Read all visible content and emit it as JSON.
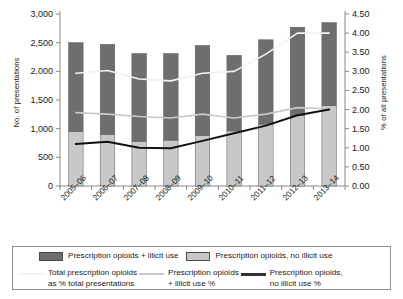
{
  "chart_data": {
    "type": "bar",
    "title": "",
    "subtitle": "",
    "xlabel": "",
    "ylabel": "No. of presentations",
    "y2label": "% of all presentations",
    "categories": [
      "2005–06",
      "2006–07",
      "2007–08",
      "2008–09",
      "2009–10",
      "2010–11",
      "2011–12",
      "2012–13",
      "2013–14"
    ],
    "ylim": [
      0,
      3000
    ],
    "yticks": [
      0,
      500,
      1000,
      1500,
      2000,
      2500,
      3000
    ],
    "ytick_labels": [
      "0",
      "500",
      "1,000",
      "1,500",
      "2,000",
      "2,500",
      "3,000"
    ],
    "y2lim": [
      0,
      4.5
    ],
    "y2ticks": [
      0,
      0.5,
      1,
      1.5,
      2,
      2.5,
      3,
      3.5,
      4,
      4.5
    ],
    "y2tick_labels": [
      "0.00",
      "0.50",
      "1.00",
      "1.50",
      "2.00",
      "2.50",
      "3.00",
      "3.50",
      "4.00",
      "4.50"
    ],
    "grid": false,
    "stacked": true,
    "legend_position": "bottom",
    "series": [
      {
        "name": "Prescription opioids, no illicit use",
        "kind": "bar-segment",
        "stack_order": 0,
        "axis": "left",
        "color": "#c8c8c8",
        "values": [
          950,
          900,
          780,
          800,
          880,
          960,
          1080,
          1230,
          1400
        ]
      },
      {
        "name": "Prescription opioids + illicit use",
        "kind": "bar-segment",
        "stack_order": 1,
        "axis": "left",
        "color": "#6e6e6e",
        "values": [
          1550,
          1570,
          1530,
          1510,
          1570,
          1320,
          1470,
          1540,
          1450
        ]
      },
      {
        "name": "Total prescription opioids as % total presentations",
        "kind": "line",
        "axis": "right",
        "color": "#f2f2f2",
        "values": [
          2.95,
          3.02,
          2.8,
          2.75,
          2.95,
          3.0,
          3.45,
          4.0,
          4.0
        ]
      },
      {
        "name": "Prescription opioids + illicit use %",
        "kind": "line",
        "axis": "right",
        "color": "#c9c9c9",
        "values": [
          1.92,
          1.88,
          1.82,
          1.78,
          1.88,
          1.78,
          1.88,
          2.05,
          2.02
        ]
      },
      {
        "name": "Prescription opioids, no illicit use %",
        "kind": "line",
        "axis": "right",
        "color": "#111111",
        "values": [
          1.1,
          1.16,
          1.0,
          0.99,
          1.18,
          1.38,
          1.58,
          1.85,
          2.0
        ]
      }
    ],
    "bar_totals": [
      2500,
      2470,
      2310,
      2310,
      2450,
      2280,
      2550,
      2770,
      2850
    ]
  },
  "axes": {
    "y_left_title": "No. of presentations",
    "y_right_title": "% of all presentations"
  },
  "legend": {
    "bars": [
      {
        "label": "Prescription opioids + illicit use",
        "color": "#6e6e6e"
      },
      {
        "label": "Prescription opioids, no illicit use",
        "color": "#c8c8c8"
      }
    ],
    "lines": [
      {
        "label": "Total prescription opioids\nas % total presentations",
        "color": "#f2f2f2"
      },
      {
        "label": "Prescription opioids\n+ illicit use %",
        "color": "#c9c9c9"
      },
      {
        "label": "Prescription opioids,\nno illicit use %",
        "color": "#333333"
      }
    ]
  }
}
